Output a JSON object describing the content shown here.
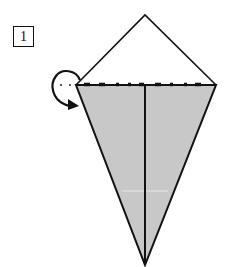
{
  "step": {
    "number": "1"
  },
  "diagram": {
    "fill_color": "#c8c8c8",
    "stroke_color": "#111111",
    "elements": [
      {
        "name": "top-triangle-flap",
        "type": "outline-triangle",
        "points": [
          [
            76,
            85
          ],
          [
            145,
            15
          ],
          [
            216,
            85
          ]
        ]
      },
      {
        "name": "kite-body",
        "type": "shaded-triangle",
        "points": [
          [
            76,
            85
          ],
          [
            216,
            85
          ],
          [
            145,
            265
          ]
        ]
      },
      {
        "name": "center-crease",
        "type": "line",
        "from": [
          145,
          85
        ],
        "to": [
          145,
          265
        ]
      },
      {
        "name": "fold-line",
        "type": "dashed-line",
        "from": [
          76,
          85
        ],
        "to": [
          216,
          85
        ]
      },
      {
        "name": "turn-over-arrow",
        "type": "curved-arrow",
        "meaning": "fold top flap behind"
      }
    ]
  }
}
